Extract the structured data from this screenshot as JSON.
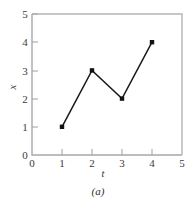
{
  "chart_data": {
    "type": "line",
    "title": "",
    "subtitle": "",
    "caption": "(a)",
    "xlabel": "t",
    "ylabel": "x",
    "xlim": [
      0,
      5
    ],
    "ylim": [
      0,
      5
    ],
    "xticks": [
      "0",
      "1",
      "2",
      "3",
      "4",
      "5"
    ],
    "yticks": [
      "0",
      "1",
      "2",
      "3",
      "4",
      "5"
    ],
    "grid": false,
    "legend": false,
    "legend_position": "none",
    "marker": "filled-square",
    "line_color": "#1a1a1a",
    "axis_color": "#a8a8a8",
    "x": [
      1,
      2,
      3,
      4
    ],
    "values": [
      1,
      3,
      2,
      4
    ],
    "points": [
      {
        "t": 1,
        "x": 1
      },
      {
        "t": 2,
        "x": 3
      },
      {
        "t": 3,
        "x": 2
      },
      {
        "t": 4,
        "x": 4
      }
    ]
  }
}
